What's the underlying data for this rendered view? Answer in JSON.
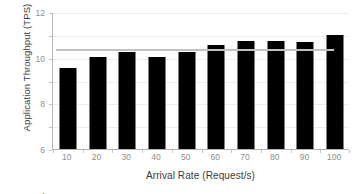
{
  "chart_data": {
    "type": "bar",
    "title": "",
    "xlabel": "Arrival Rate (Request/s)",
    "ylabel": "Application Throughput (TPS)",
    "categories": [
      "10",
      "20",
      "30",
      "40",
      "50",
      "60",
      "70",
      "80",
      "90",
      "100"
    ],
    "values": [
      7.1,
      8.05,
      8.5,
      8.05,
      8.5,
      9.15,
      9.45,
      9.5,
      9.4,
      10.0
    ],
    "series": [
      {
        "name": "Application Throughput",
        "values": [
          7.1,
          8.05,
          8.5,
          8.05,
          8.5,
          9.15,
          9.45,
          9.5,
          9.4,
          10.0
        ],
        "color": "#000000"
      }
    ],
    "ylim": [
      0,
      12
    ],
    "yticks": [
      0,
      2,
      4,
      6,
      8,
      10,
      12
    ],
    "ytick_labels": [
      "0",
      "2",
      "4",
      "6",
      "8",
      "10",
      "12"
    ],
    "xtick_labels": [
      "10",
      "20",
      "30",
      "40",
      "50",
      "60",
      "70",
      "80",
      "90",
      "100"
    ],
    "grid": true,
    "legend": false,
    "annotations": [
      {
        "name": "reference-line",
        "kind": "horizontal-line",
        "value": 8.75,
        "color": "#c2c2c2",
        "x_start_category": "10",
        "x_end_category": "100"
      }
    ]
  },
  "colors": {
    "bar": "#000000",
    "gridline": "#ededed",
    "axis": "#b2b2b2",
    "tick_text": "#8e8e8e",
    "title_text": "#3a3a3a",
    "reference_line": "#c2c2c2",
    "background": "#ffffff"
  }
}
